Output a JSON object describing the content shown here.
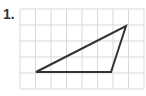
{
  "problem": {
    "number_label": "1."
  },
  "grid": {
    "columns": 8,
    "rows": 5,
    "line_color": "#d9d9d9"
  },
  "triangle": {
    "stroke_color": "#333333",
    "vertices_grid": [
      [
        1,
        4
      ],
      [
        6,
        4
      ],
      [
        7,
        1
      ]
    ]
  }
}
